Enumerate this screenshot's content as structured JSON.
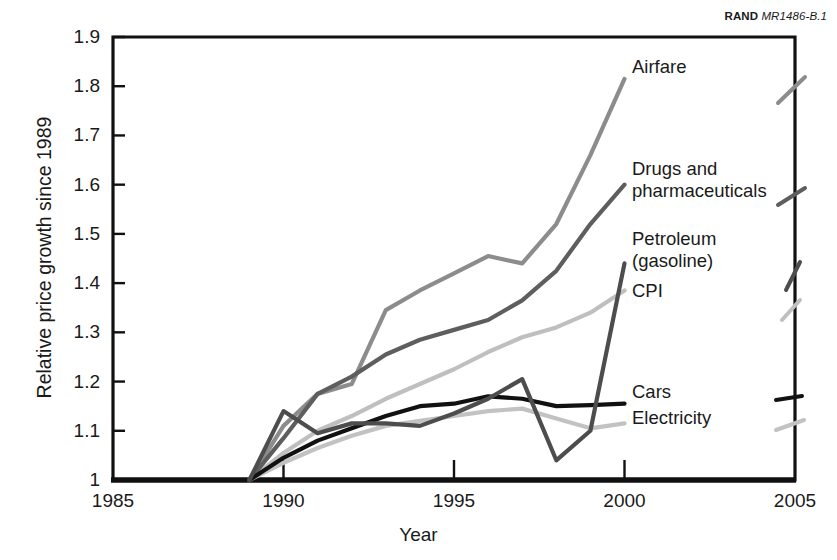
{
  "source_credit": {
    "organization": "RAND",
    "document_id": "MR1486-B.1"
  },
  "axis_titles": {
    "x": "Year",
    "y": "Relative price growth since 1989"
  },
  "chart_data": {
    "type": "line",
    "title": "",
    "subtitle": "",
    "xlabel": "Year",
    "ylabel": "Relative price growth since 1989",
    "xlim": [
      1985,
      2005
    ],
    "ylim": [
      1,
      1.9
    ],
    "grid": false,
    "legend_position": "right-inline-labels",
    "xticks": [
      1985,
      1990,
      1995,
      2000,
      2005
    ],
    "xtick_labels": [
      "1985",
      "1990",
      "1995",
      "2000",
      "2005"
    ],
    "yticks": [
      1,
      1.1,
      1.2,
      1.3,
      1.4,
      1.5,
      1.6,
      1.7,
      1.8,
      1.9
    ],
    "ytick_labels": [
      "1",
      "1.1",
      "1.2",
      "1.3",
      "1.4",
      "1.5",
      "1.6",
      "1.7",
      "1.8",
      "1.9"
    ],
    "x": [
      1989,
      1990,
      1991,
      1992,
      1993,
      1994,
      1995,
      1996,
      1997,
      1998,
      1999,
      2000
    ],
    "series": [
      {
        "name": "Airfare",
        "color": "#8c8c8c",
        "values": [
          1.0,
          1.11,
          1.175,
          1.195,
          1.345,
          1.385,
          1.42,
          1.455,
          1.44,
          1.52,
          1.66,
          1.815
        ]
      },
      {
        "name": "Drugs and pharmaceuticals",
        "color": "#5e5e5e",
        "values": [
          1.0,
          1.085,
          1.175,
          1.21,
          1.255,
          1.285,
          1.305,
          1.325,
          1.365,
          1.425,
          1.52,
          1.6
        ]
      },
      {
        "name": "Petroleum (gasoline)",
        "color": "#4d4d4d",
        "values": [
          1.0,
          1.14,
          1.095,
          1.115,
          1.115,
          1.11,
          1.135,
          1.165,
          1.205,
          1.04,
          1.1,
          1.44
        ]
      },
      {
        "name": "CPI",
        "color": "#bfbfbf",
        "values": [
          1.0,
          1.055,
          1.1,
          1.13,
          1.165,
          1.195,
          1.225,
          1.26,
          1.29,
          1.31,
          1.34,
          1.385
        ]
      },
      {
        "name": "Cars",
        "color": "#111111",
        "values": [
          1.0,
          1.045,
          1.08,
          1.105,
          1.13,
          1.15,
          1.155,
          1.17,
          1.165,
          1.15,
          1.152,
          1.155
        ]
      },
      {
        "name": "Electricity",
        "color": "#c2c2c2",
        "values": [
          1.0,
          1.035,
          1.065,
          1.09,
          1.11,
          1.12,
          1.13,
          1.14,
          1.145,
          1.125,
          1.105,
          1.115
        ]
      }
    ]
  },
  "series_labels": [
    {
      "name": "Airfare",
      "text": "Airfare"
    },
    {
      "name": "Drugs and pharmaceuticals",
      "text": "Drugs and\npharmaceuticals"
    },
    {
      "name": "Petroleum (gasoline)",
      "text": "Petroleum\n(gasoline)"
    },
    {
      "name": "CPI",
      "text": "CPI"
    },
    {
      "name": "Cars",
      "text": "Cars"
    },
    {
      "name": "Electricity",
      "text": "Electricity"
    }
  ]
}
